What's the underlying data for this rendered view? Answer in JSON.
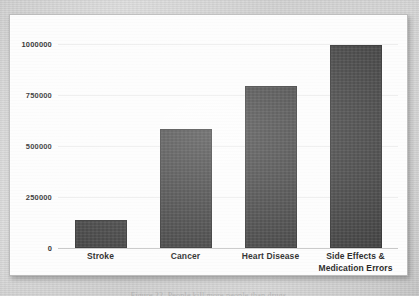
{
  "figure": {
    "caption": "Figure 22. People kill more people than drugs.",
    "panel_background": "#fdfdfd",
    "bar_color": "#3b3b3b",
    "gridline_color": "#ececec",
    "axis_color": "#c6c6c6"
  },
  "chart_data": {
    "type": "bar",
    "title": "",
    "subtitle": "",
    "xlabel": "",
    "ylabel": "",
    "categories": [
      "Stroke",
      "Cancer",
      "Heart Disease",
      "Side Effects & Medication Errors"
    ],
    "values": [
      135000,
      583000,
      795000,
      995000
    ],
    "ylim": [
      0,
      1000000
    ],
    "ytick_values": [
      0,
      250000,
      500000,
      750000,
      1000000
    ],
    "ytick_labels": [
      "0",
      "250000",
      "500000",
      "750000",
      "1000000"
    ],
    "grid": true,
    "grid_axis": "y",
    "legend": false,
    "legend_position": "none",
    "series": [
      {
        "name": "Deaths per year",
        "values": [
          135000,
          583000,
          795000,
          995000
        ]
      }
    ]
  },
  "x_axis": {
    "labels": [
      {
        "line1": "Stroke",
        "line2": ""
      },
      {
        "line1": "Cancer",
        "line2": ""
      },
      {
        "line1": "Heart Disease",
        "line2": ""
      },
      {
        "line1": "Side Effects &",
        "line2": "Medication Errors"
      }
    ]
  }
}
